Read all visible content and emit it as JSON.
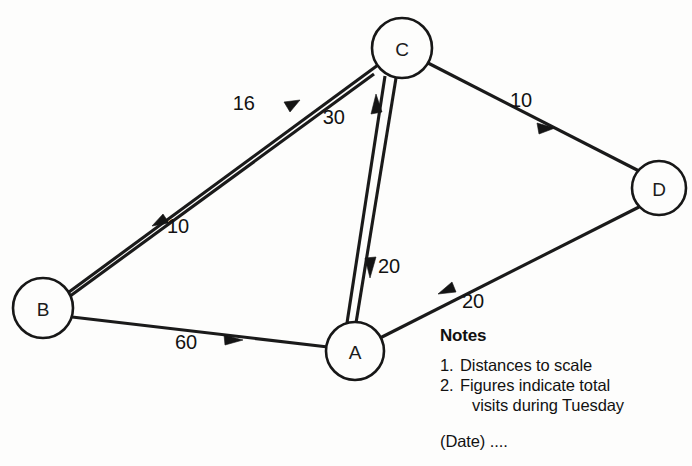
{
  "diagram": {
    "type": "directed-graph",
    "background_color": "#fdfdfc",
    "line_color": "#1a1a1a",
    "nodes": [
      {
        "id": "C",
        "label": "C",
        "cx": 402,
        "cy": 48,
        "r": 30
      },
      {
        "id": "D",
        "label": "D",
        "cx": 659,
        "cy": 188,
        "r": 27
      },
      {
        "id": "B",
        "label": "B",
        "cx": 43,
        "cy": 308,
        "r": 30
      },
      {
        "id": "A",
        "label": "A",
        "cx": 355,
        "cy": 351,
        "r": 29
      }
    ],
    "edges": [
      {
        "from": "B",
        "to": "C",
        "label": "16",
        "label_x": 255,
        "label_y": 105,
        "direction": "B-to-C"
      },
      {
        "from": "C",
        "to": "B",
        "label": "10",
        "label_x": 167,
        "label_y": 228,
        "direction": "C-to-B"
      },
      {
        "from": "A",
        "to": "C",
        "label": "30",
        "label_x": 345,
        "label_y": 119,
        "direction": "A-to-C"
      },
      {
        "from": "C",
        "to": "A",
        "label": "20",
        "label_x": 378,
        "label_y": 268,
        "direction": "C-to-A"
      },
      {
        "from": "C",
        "to": "D",
        "label": "10",
        "label_x": 521,
        "label_y": 102,
        "direction": "C-to-D"
      },
      {
        "from": "D",
        "to": "A",
        "label": "20",
        "label_x": 462,
        "label_y": 303,
        "direction": "D-to-A"
      },
      {
        "from": "B",
        "to": "A",
        "label": "60",
        "label_x": 186,
        "label_y": 344,
        "direction": "B-to-A"
      }
    ]
  },
  "notes": {
    "heading": "Notes",
    "items": [
      {
        "num": "1.",
        "text": "Distances to scale"
      },
      {
        "num": "2.",
        "text": "Figures indicate total",
        "continuation": "visits during Tuesday"
      }
    ],
    "date_line": "(Date) ...."
  }
}
